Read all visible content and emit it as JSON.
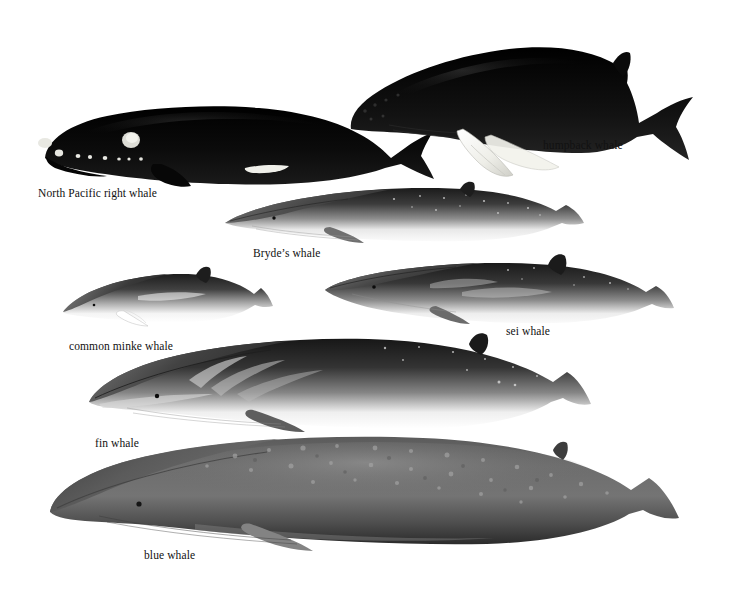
{
  "plate": {
    "background_color": "#ffffff",
    "ink_color": "#111111",
    "width": 731,
    "height": 598,
    "style": "grayscale scientific illustration plate",
    "subject": "baleen whales of the North Pacific"
  },
  "species": [
    {
      "id": "north-pacific-right-whale",
      "label": "North Pacific right whale",
      "label_x": 38,
      "label_y": 187,
      "fig_x": 33,
      "fig_y": 96,
      "fig_w": 405,
      "fig_h": 90,
      "body_color": "#0d0d0d",
      "accent_color": "#efefe9",
      "has_dorsal_fin": false,
      "notes": "stocky black body, arched jaw, white callosities, broad paddle flipper, notched flukes"
    },
    {
      "id": "humpback-whale",
      "label": "humpback whale",
      "label_x": 543,
      "label_y": 139,
      "fig_x": 345,
      "fig_y": 33,
      "fig_w": 350,
      "fig_h": 145,
      "body_color": "#151515",
      "accent_color": "#f4f4ee",
      "has_dorsal_fin": true,
      "notes": "very long white pectoral flippers, knobbed rostrum, low humped dorsal fin"
    },
    {
      "id": "brydes-whale",
      "label": "Bryde’s whale",
      "label_x": 253,
      "label_y": 247,
      "fig_x": 222,
      "fig_y": 183,
      "fig_w": 365,
      "fig_h": 62,
      "body_color": "#3a3a3a",
      "accent_color": "#fbfbfb",
      "has_dorsal_fin": true,
      "notes": "slender rorqual, dark dorsal grading to pale belly, light speckling"
    },
    {
      "id": "common-minke-whale",
      "label": "common minke whale",
      "label_x": 69,
      "label_y": 340,
      "fig_x": 60,
      "fig_y": 268,
      "fig_w": 215,
      "fig_h": 58,
      "body_color": "#3d3d3d",
      "accent_color": "#ffffff",
      "has_dorsal_fin": true,
      "notes": "smallest rorqual, white band across the flipper, falcate dorsal fin"
    },
    {
      "id": "sei-whale",
      "label": "sei whale",
      "label_x": 506,
      "label_y": 325,
      "fig_x": 322,
      "fig_y": 258,
      "fig_w": 355,
      "fig_h": 68,
      "body_color": "#363636",
      "accent_color": "#fafafa",
      "has_dorsal_fin": true,
      "notes": "tall erect dorsal fin set well forward, dark steely grey with pale flank swirls"
    },
    {
      "id": "fin-whale",
      "label": "fin whale",
      "label_x": 95,
      "label_y": 437,
      "fig_x": 85,
      "fig_y": 336,
      "fig_w": 545,
      "fig_h": 98,
      "body_color": "#2e2e2e",
      "accent_color": "#ffffff",
      "has_dorsal_fin": true,
      "notes": "long sleek body, pale chevron behind the head, asymmetrical light right jaw"
    },
    {
      "id": "blue-whale",
      "label": "blue whale",
      "label_x": 144,
      "label_y": 549,
      "fig_x": 45,
      "fig_y": 436,
      "fig_w": 670,
      "fig_h": 115,
      "body_color": "#4a4a4a",
      "accent_color": "#9a9a9a",
      "has_dorsal_fin": true,
      "notes": "largest species, mottled blue-grey, broad flat rostrum, tiny dorsal fin set far back"
    }
  ]
}
